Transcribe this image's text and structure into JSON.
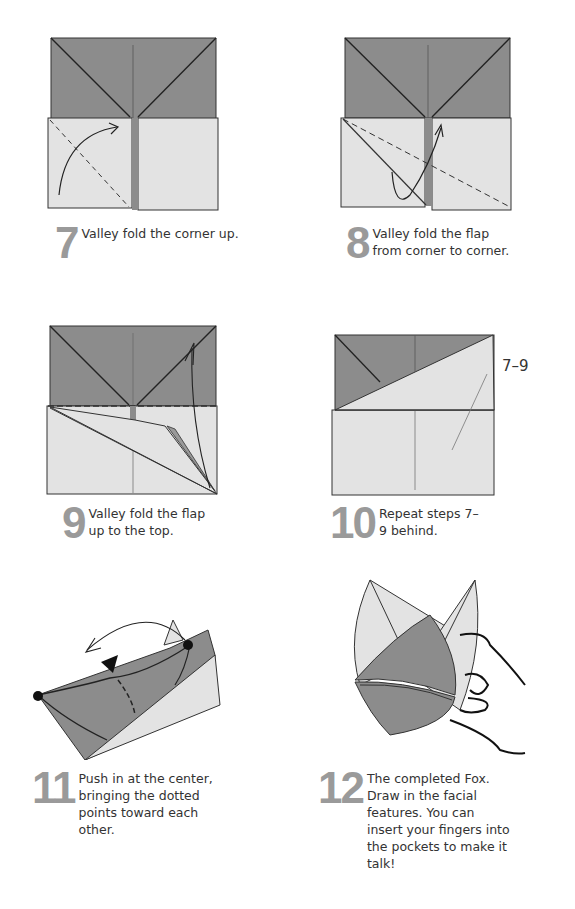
{
  "colors": {
    "dark_paper": "#8c8c8c",
    "light_paper": "#e3e3e3",
    "line": "#333333",
    "step_number": "#9a9a9a"
  },
  "steps": [
    {
      "number": "7",
      "text": "Valley fold the corner up."
    },
    {
      "number": "8",
      "text": "Valley fold the flap from corner to corner."
    },
    {
      "number": "9",
      "text": "Valley fold the flap up to the top."
    },
    {
      "number": "10",
      "text": "Repeat steps 7–9 behind.",
      "callout": "7–9"
    },
    {
      "number": "11",
      "text": "Push in at the center, bringing the dotted points toward each other."
    },
    {
      "number": "12",
      "text": "The completed Fox. Draw in the facial features. You can insert your fingers into the pockets to make it talk!"
    }
  ]
}
